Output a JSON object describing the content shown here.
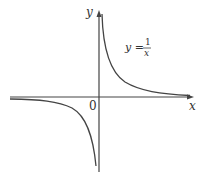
{
  "diagram": {
    "type": "function-graph",
    "function": "y = 1/x",
    "axes": {
      "x_label": "x",
      "y_label": "y",
      "origin_label": "0"
    },
    "equation_label": {
      "lhs": "y =",
      "numerator": "1",
      "denominator": "x"
    },
    "colors": {
      "axis": "#444444",
      "curve": "#444444",
      "background": "#ffffff"
    }
  }
}
